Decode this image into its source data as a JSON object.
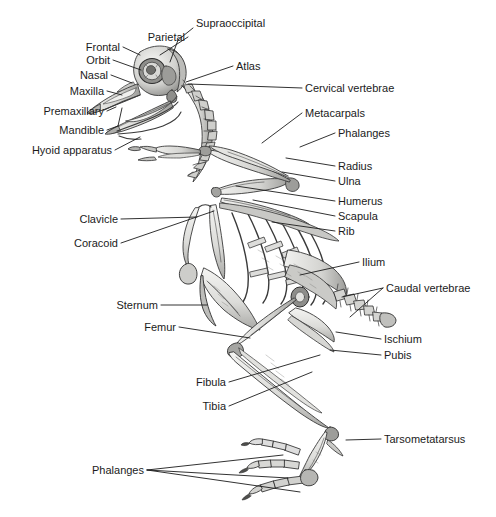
{
  "figure": {
    "background_color": "#ffffff",
    "label_color": "#1b1b1b",
    "leader_color": "#1b1b1b",
    "bone_fill": "#e9e9e7",
    "bone_stroke": "#3a3a3a",
    "bone_shadow": "#9a9a98"
  },
  "labels": [
    {
      "id": "supraoccipital",
      "text": "Supraoccipital",
      "align": "left",
      "x": 196,
      "y": 23,
      "leaders": [
        [
          [
            193,
            28
          ],
          [
            178,
            40
          ],
          [
            170,
            62
          ]
        ]
      ]
    },
    {
      "id": "parietal",
      "text": "Parietal",
      "align": "right",
      "x": 185,
      "y": 37,
      "leaders": [
        [
          [
            188,
            37
          ],
          [
            160,
            55
          ]
        ]
      ]
    },
    {
      "id": "frontal",
      "text": "Frontal",
      "align": "right",
      "x": 120,
      "y": 47,
      "leaders": [
        [
          [
            123,
            47
          ],
          [
            140,
            55
          ]
        ]
      ]
    },
    {
      "id": "orbit",
      "text": "Orbit",
      "align": "right",
      "x": 110,
      "y": 60,
      "leaders": [
        [
          [
            113,
            60
          ],
          [
            141,
            70
          ]
        ]
      ]
    },
    {
      "id": "nasal",
      "text": "Nasal",
      "align": "right",
      "x": 108,
      "y": 75,
      "leaders": [
        [
          [
            111,
            75
          ],
          [
            132,
            83
          ]
        ]
      ]
    },
    {
      "id": "maxilla",
      "text": "Maxilla",
      "align": "right",
      "x": 104,
      "y": 91,
      "leaders": [
        [
          [
            107,
            91
          ],
          [
            122,
            95
          ]
        ]
      ]
    },
    {
      "id": "premaxillary",
      "text": "Premaxillary",
      "align": "right",
      "x": 104,
      "y": 111,
      "leaders": [
        [
          [
            107,
            111
          ],
          [
            116,
            107
          ]
        ]
      ]
    },
    {
      "id": "mandible",
      "text": "Mandible",
      "align": "right",
      "x": 104,
      "y": 130,
      "leaders": [
        [
          [
            107,
            130
          ],
          [
            118,
            126
          ],
          [
            122,
            108
          ]
        ]
      ]
    },
    {
      "id": "hyoid-apparatus",
      "text": "Hyoid apparatus",
      "align": "right",
      "x": 112,
      "y": 150,
      "leaders": [
        [
          [
            115,
            150
          ],
          [
            140,
            137
          ]
        ]
      ]
    },
    {
      "id": "atlas",
      "text": "Atlas",
      "align": "left",
      "x": 236,
      "y": 66,
      "leaders": [
        [
          [
            233,
            66
          ],
          [
            186,
            82
          ]
        ]
      ]
    },
    {
      "id": "cervical-vertebrae",
      "text": "Cervical vertebrae",
      "align": "left",
      "x": 305,
      "y": 88,
      "leaders": [
        [
          [
            302,
            88
          ],
          [
            188,
            84
          ]
        ]
      ]
    },
    {
      "id": "metacarpals",
      "text": "Metacarpals",
      "align": "left",
      "x": 305,
      "y": 113,
      "leaders": [
        [
          [
            302,
            113
          ],
          [
            262,
            143
          ]
        ]
      ]
    },
    {
      "id": "phalanges-wing",
      "text": "Phalanges",
      "align": "left",
      "x": 338,
      "y": 133,
      "leaders": [
        [
          [
            335,
            133
          ],
          [
            300,
            147
          ]
        ]
      ]
    },
    {
      "id": "radius",
      "text": "Radius",
      "align": "left",
      "x": 338,
      "y": 166,
      "leaders": [
        [
          [
            335,
            166
          ],
          [
            286,
            158
          ]
        ]
      ]
    },
    {
      "id": "ulna",
      "text": "Ulna",
      "align": "left",
      "x": 338,
      "y": 181,
      "leaders": [
        [
          [
            335,
            181
          ],
          [
            282,
            172
          ]
        ]
      ]
    },
    {
      "id": "humerus",
      "text": "Humerus",
      "align": "left",
      "x": 338,
      "y": 201,
      "leaders": [
        [
          [
            335,
            201
          ],
          [
            236,
            186
          ]
        ]
      ]
    },
    {
      "id": "scapula",
      "text": "Scapula",
      "align": "left",
      "x": 338,
      "y": 216,
      "leaders": [
        [
          [
            335,
            216
          ],
          [
            253,
            200
          ]
        ]
      ]
    },
    {
      "id": "rib",
      "text": "Rib",
      "align": "left",
      "x": 338,
      "y": 231,
      "leaders": [
        [
          [
            335,
            231
          ],
          [
            272,
            222
          ]
        ]
      ]
    },
    {
      "id": "ilium",
      "text": "Ilium",
      "align": "left",
      "x": 362,
      "y": 262,
      "leaders": [
        [
          [
            359,
            262
          ],
          [
            300,
            275
          ]
        ]
      ]
    },
    {
      "id": "caudal-vertebrae",
      "text": "Caudal vertebrae",
      "align": "left",
      "x": 386,
      "y": 288,
      "leaders": [
        [
          [
            383,
            288
          ],
          [
            342,
            297
          ]
        ],
        [
          [
            383,
            288
          ],
          [
            350,
            317
          ]
        ]
      ]
    },
    {
      "id": "ischium",
      "text": "Ischium",
      "align": "left",
      "x": 384,
      "y": 339,
      "leaders": [
        [
          [
            381,
            339
          ],
          [
            336,
            332
          ]
        ]
      ]
    },
    {
      "id": "pubis",
      "text": "Pubis",
      "align": "left",
      "x": 384,
      "y": 355,
      "leaders": [
        [
          [
            381,
            355
          ],
          [
            330,
            350
          ]
        ]
      ]
    },
    {
      "id": "clavicle",
      "text": "Clavicle",
      "align": "right",
      "x": 118,
      "y": 219,
      "leaders": [
        [
          [
            121,
            219
          ],
          [
            197,
            217
          ]
        ]
      ]
    },
    {
      "id": "coracoid",
      "text": "Coracoid",
      "align": "right",
      "x": 118,
      "y": 243,
      "leaders": [
        [
          [
            121,
            243
          ],
          [
            214,
            211
          ]
        ]
      ]
    },
    {
      "id": "sternum",
      "text": "Sternum",
      "align": "right",
      "x": 158,
      "y": 305,
      "leaders": [
        [
          [
            161,
            305
          ],
          [
            207,
            305
          ]
        ]
      ]
    },
    {
      "id": "femur",
      "text": "Femur",
      "align": "right",
      "x": 176,
      "y": 327,
      "leaders": [
        [
          [
            179,
            327
          ],
          [
            250,
            338
          ]
        ]
      ]
    },
    {
      "id": "fibula",
      "text": "Fibula",
      "align": "right",
      "x": 226,
      "y": 382,
      "leaders": [
        [
          [
            229,
            382
          ],
          [
            320,
            355
          ]
        ]
      ]
    },
    {
      "id": "tibia",
      "text": "Tibia",
      "align": "right",
      "x": 226,
      "y": 406,
      "leaders": [
        [
          [
            229,
            406
          ],
          [
            312,
            372
          ]
        ]
      ]
    },
    {
      "id": "tarsometatarsus",
      "text": "Tarsometatarsus",
      "align": "left",
      "x": 384,
      "y": 439,
      "leaders": [
        [
          [
            381,
            439
          ],
          [
            346,
            440
          ]
        ]
      ]
    },
    {
      "id": "phalanges-foot",
      "text": "Phalanges",
      "align": "right",
      "x": 144,
      "y": 470,
      "leaders": [
        [
          [
            147,
            470
          ],
          [
            283,
            455
          ]
        ],
        [
          [
            147,
            470
          ],
          [
            288,
            478
          ]
        ],
        [
          [
            147,
            470
          ],
          [
            300,
            492
          ]
        ]
      ]
    }
  ]
}
